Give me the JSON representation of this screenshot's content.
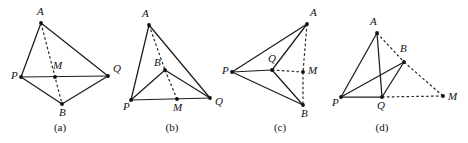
{
  "figure": {
    "background_color": "#ffffff",
    "line_color": "#1c1c1c",
    "panel_count": 4,
    "panels": [
      {
        "caption": "(a)",
        "caption_x": 60,
        "caption_y": 131,
        "points": [
          {
            "label": "A",
            "x": 41,
            "y": 23,
            "lx": 37,
            "ly": 15
          },
          {
            "label": "P",
            "x": 21,
            "y": 77,
            "lx": 11,
            "ly": 79
          },
          {
            "label": "M",
            "x": 55,
            "y": 77,
            "lx": 53,
            "ly": 69
          },
          {
            "label": "Q",
            "x": 108,
            "y": 76,
            "lx": 113,
            "ly": 72
          },
          {
            "label": "B",
            "x": 62,
            "y": 104,
            "lx": 59,
            "ly": 116
          }
        ],
        "solid_edges": [
          [
            "A",
            "P"
          ],
          [
            "A",
            "Q"
          ],
          [
            "P",
            "Q"
          ],
          [
            "P",
            "B"
          ],
          [
            "B",
            "Q"
          ]
        ],
        "dashed_edges": [
          [
            "A",
            "B"
          ]
        ]
      },
      {
        "caption": "(b)",
        "caption_x": 172,
        "caption_y": 131,
        "points": [
          {
            "label": "A",
            "x": 149,
            "y": 25,
            "lx": 142,
            "ly": 17
          },
          {
            "label": "B",
            "x": 165,
            "y": 70,
            "lx": 154,
            "ly": 66
          },
          {
            "label": "P",
            "x": 131,
            "y": 100,
            "lx": 123,
            "ly": 110
          },
          {
            "label": "M",
            "x": 177,
            "y": 99,
            "lx": 173,
            "ly": 111
          },
          {
            "label": "Q",
            "x": 210,
            "y": 98,
            "lx": 215,
            "ly": 105
          }
        ],
        "solid_edges": [
          [
            "A",
            "P"
          ],
          [
            "A",
            "Q"
          ],
          [
            "P",
            "Q"
          ],
          [
            "P",
            "B"
          ],
          [
            "B",
            "Q"
          ]
        ],
        "dashed_edges": [
          [
            "A",
            "B"
          ],
          [
            "B",
            "M"
          ]
        ]
      },
      {
        "caption": "(c)",
        "caption_x": 280,
        "caption_y": 131,
        "points": [
          {
            "label": "A",
            "x": 307,
            "y": 24,
            "lx": 310,
            "ly": 16
          },
          {
            "label": "P",
            "x": 232,
            "y": 72,
            "lx": 222,
            "ly": 74
          },
          {
            "label": "Q",
            "x": 272,
            "y": 70,
            "lx": 268,
            "ly": 62
          },
          {
            "label": "M",
            "x": 303,
            "y": 72,
            "lx": 308,
            "ly": 74
          },
          {
            "label": "B",
            "x": 303,
            "y": 105,
            "lx": 301,
            "ly": 117
          }
        ],
        "solid_edges": [
          [
            "P",
            "A"
          ],
          [
            "P",
            "Q"
          ],
          [
            "P",
            "B"
          ],
          [
            "Q",
            "A"
          ],
          [
            "Q",
            "B"
          ]
        ],
        "dashed_edges": [
          [
            "A",
            "M"
          ],
          [
            "M",
            "B"
          ],
          [
            "Q",
            "M"
          ]
        ]
      },
      {
        "caption": "(d)",
        "caption_x": 382,
        "caption_y": 131,
        "points": [
          {
            "label": "A",
            "x": 377,
            "y": 33,
            "lx": 370,
            "ly": 25
          },
          {
            "label": "B",
            "x": 404,
            "y": 62,
            "lx": 400,
            "ly": 52
          },
          {
            "label": "P",
            "x": 341,
            "y": 97,
            "lx": 332,
            "ly": 106
          },
          {
            "label": "Q",
            "x": 382,
            "y": 97,
            "lx": 377,
            "ly": 109
          },
          {
            "label": "M",
            "x": 443,
            "y": 96,
            "lx": 448,
            "ly": 100
          }
        ],
        "solid_edges": [
          [
            "A",
            "P"
          ],
          [
            "A",
            "Q"
          ],
          [
            "P",
            "Q"
          ],
          [
            "P",
            "B"
          ],
          [
            "Q",
            "B"
          ]
        ],
        "dashed_edges": [
          [
            "A",
            "B"
          ],
          [
            "B",
            "M"
          ],
          [
            "Q",
            "M"
          ]
        ]
      }
    ]
  }
}
